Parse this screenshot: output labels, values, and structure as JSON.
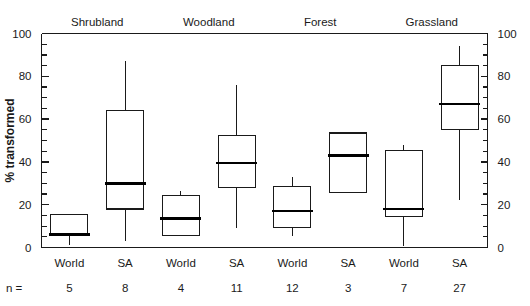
{
  "chart_data": {
    "type": "box",
    "title": "",
    "xlabel": "",
    "ylabel": "% transformed",
    "ylim": [
      0,
      100
    ],
    "yticks": [
      0,
      20,
      40,
      60,
      80,
      100
    ],
    "ytick_labels": [
      "0",
      "20",
      "40",
      "60",
      "80",
      "100"
    ],
    "yticks_minor": [
      5,
      10,
      15,
      25,
      30,
      35,
      45,
      50,
      55,
      65,
      70,
      75,
      85,
      90,
      95
    ],
    "grid": false,
    "legend": "none",
    "dual_axis": true,
    "right_axis_labels": [
      "0",
      "20",
      "40",
      "60",
      "80",
      "100"
    ],
    "n_prefix": "n =",
    "groups": [
      {
        "label": "Shrubland"
      },
      {
        "label": "Woodland"
      },
      {
        "label": "Forest"
      },
      {
        "label": "Grassland"
      }
    ],
    "categories": [
      "World",
      "SA",
      "World",
      "SA",
      "World",
      "SA",
      "World",
      "SA"
    ],
    "n_values": [
      5,
      8,
      4,
      11,
      12,
      3,
      7,
      27
    ],
    "boxes": [
      {
        "group": "Shrubland",
        "category": "World",
        "n": 5,
        "whisker_low": 1.0,
        "q1": 6.0,
        "median": 6.0,
        "q3": 15.5,
        "whisker_high": 15.5
      },
      {
        "group": "Shrubland",
        "category": "SA",
        "n": 8,
        "whisker_low": 3.0,
        "q1": 18.0,
        "median": 30.0,
        "q3": 64.0,
        "whisker_high": 87.0
      },
      {
        "group": "Woodland",
        "category": "World",
        "n": 4,
        "whisker_low": 5.5,
        "q1": 5.5,
        "median": 13.5,
        "q3": 24.5,
        "whisker_high": 26.5
      },
      {
        "group": "Woodland",
        "category": "SA",
        "n": 11,
        "whisker_low": 9.0,
        "q1": 28.0,
        "median": 39.5,
        "q3": 52.5,
        "whisker_high": 76.0
      },
      {
        "group": "Forest",
        "category": "World",
        "n": 12,
        "whisker_low": 5.5,
        "q1": 9.5,
        "median": 17.0,
        "q3": 28.5,
        "whisker_high": 33.0
      },
      {
        "group": "Forest",
        "category": "SA",
        "n": 3,
        "whisker_low": 25.5,
        "q1": 25.5,
        "median": 43.0,
        "q3": 53.5,
        "whisker_high": 53.5
      },
      {
        "group": "Grassland",
        "category": "World",
        "n": 7,
        "whisker_low": 0.5,
        "q1": 14.5,
        "median": 18.0,
        "q3": 45.5,
        "whisker_high": 48.0
      },
      {
        "group": "Grassland",
        "category": "SA",
        "n": 27,
        "whisker_low": 22.0,
        "q1": 55.0,
        "median": 67.0,
        "q3": 85.0,
        "whisker_high": 94.0
      }
    ],
    "colors": {
      "line": "#1a1a1a",
      "median": "#000000",
      "background": "#ffffff"
    }
  }
}
